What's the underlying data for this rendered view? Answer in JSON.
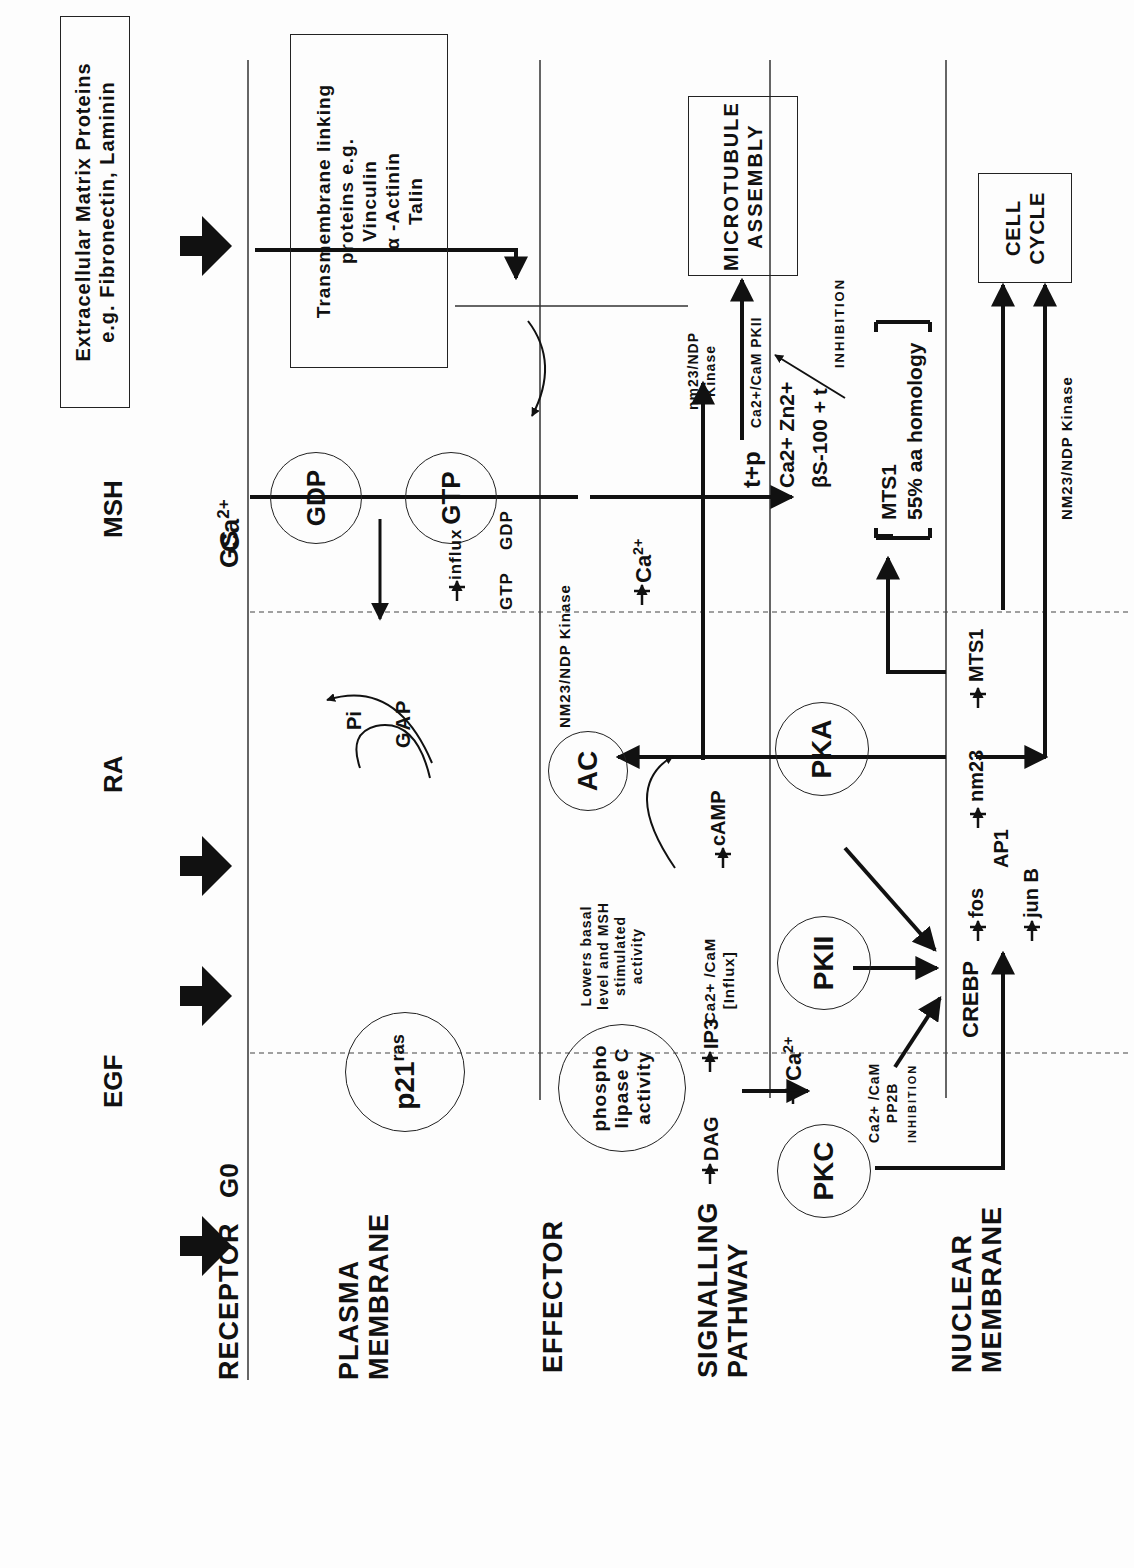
{
  "rows": {
    "receptor": "RECEPTOR",
    "plasma_membrane": [
      "PLASMA",
      "MEMBRANE"
    ],
    "effector": "EFFECTOR",
    "signalling_pathway": [
      "SIGNALLING",
      "PATHWAY"
    ],
    "nuclear_membrane": [
      "NUCLEAR",
      "MEMBRANE"
    ]
  },
  "receptors": {
    "egf": "EGF",
    "ra": "RA",
    "msh": "MSH",
    "ecm": [
      "Extracellular Matrix Proteins",
      "e.g. Fibronectin, Laminin"
    ],
    "ca": "Ca",
    "ca_sup": "2+"
  },
  "g_proteins": {
    "g0": "G0",
    "gs": "GS"
  },
  "plasma": {
    "p21": "p21",
    "p21_sup": "ras",
    "gdp": "GDP",
    "gtp": "GTP",
    "pi": "Pi",
    "gap": "GAP",
    "transmembrane": [
      "Transmembrane linking",
      "proteins e.g.",
      "Vinculin",
      "α -Actinin",
      "Talin"
    ],
    "influx": "influx",
    "gtp_small": "GTP",
    "gdp_small": "GDP"
  },
  "effector": {
    "plc": [
      "phospho",
      "lipase C",
      "activity"
    ],
    "ac": "AC",
    "lowers": [
      "Lowers basal",
      "level and MSH",
      "stimulated",
      "activity"
    ],
    "nm23_kinase": "NM23/NDP Kinase",
    "microtubule": [
      "MICROTUBULE",
      "ASSEMBLY"
    ],
    "nm23_kinase_small": [
      "nm23/NDP",
      "Kinase"
    ],
    "ca_cam_pkii": "Ca2+/CaM PKII",
    "inhibition": "INHIBITION",
    "tp": "t+p"
  },
  "signalling": {
    "dag": "DAG",
    "ip3": "IP3",
    "ca": "Ca",
    "ca_sup": "2+",
    "ca_cam_influx": [
      "Ca2+ /CaM",
      "[Influx]"
    ],
    "pkii": "PKII",
    "pka": "PKA",
    "pkc": "PKC",
    "camp": "cAMP",
    "ca_cam_pp2b": [
      "Ca2+ /CaM",
      "PP2B"
    ],
    "inhibition": "INHIBITION",
    "ca_mid": "Ca",
    "ca_zn": "Ca2+  Zn2+",
    "s100": "βS-100 + t",
    "mts1_bracket": [
      "MTS1",
      "55% aa homology"
    ]
  },
  "nuclear": {
    "crebp": "CREBP",
    "fos": "fos",
    "ap1": "AP1",
    "jun_b": "jun B",
    "nm23": "nm23",
    "mts1": "MTS1",
    "cell_cycle": [
      "CELL",
      "CYCLE"
    ],
    "nm23_kinase": "NM23/NDP Kinase"
  }
}
